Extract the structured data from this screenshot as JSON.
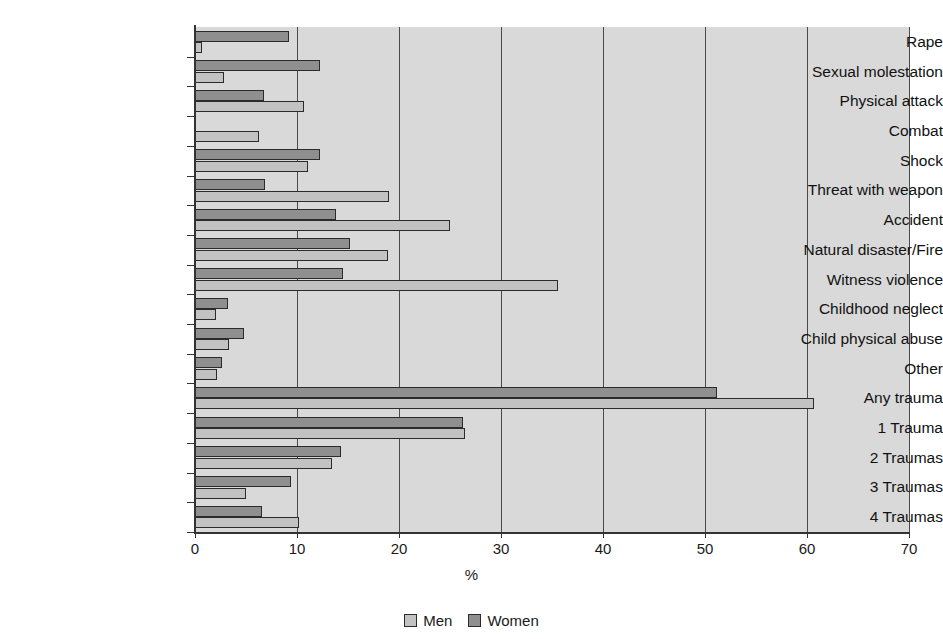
{
  "chart_data": {
    "type": "bar",
    "orientation": "horizontal",
    "title": "",
    "xlabel": "%",
    "ylabel": "",
    "xlim": [
      0,
      70
    ],
    "xticks": [
      0,
      10,
      20,
      30,
      40,
      50,
      60,
      70
    ],
    "grid": true,
    "legend_position": "bottom-center",
    "categories": [
      "Rape",
      "Sexual molestation",
      "Physical attack",
      "Combat",
      "Shock",
      "Threat with weapon",
      "Accident",
      "Natural disaster/Fire",
      "Witness violence",
      "Childhood neglect",
      "Child physical abuse",
      "Other",
      "Any trauma",
      "1 Trauma",
      "2 Traumas",
      "3 Traumas",
      "4 Traumas"
    ],
    "series": [
      {
        "name": "Women",
        "color": "#8f8f8f",
        "values": [
          9.2,
          12.3,
          6.8,
          0.0,
          12.3,
          6.9,
          13.8,
          15.2,
          14.5,
          3.2,
          4.8,
          2.6,
          51.2,
          26.3,
          14.3,
          9.4,
          6.6
        ]
      },
      {
        "name": "Men",
        "color": "#c2c2c2",
        "values": [
          0.7,
          2.8,
          10.7,
          6.3,
          11.1,
          19.0,
          25.0,
          18.9,
          35.6,
          2.1,
          3.3,
          2.2,
          60.7,
          26.5,
          13.4,
          5.0,
          10.2
        ]
      }
    ]
  },
  "legend": {
    "items": [
      {
        "label": "Men",
        "swatch": "men-swatch"
      },
      {
        "label": "Women",
        "swatch": "women-swatch"
      }
    ]
  },
  "axis": {
    "x_title": "%"
  }
}
